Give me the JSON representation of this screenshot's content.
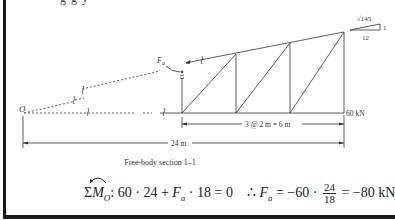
{
  "top_cutoff_text": "g                                   g                                          y",
  "diagram": {
    "point_label": "O",
    "force_label": "F",
    "force_subscript": "a",
    "load_label": "60 kN",
    "dimension_panels": "3 @ 2 m = 6 m",
    "dimension_total": "24 m",
    "slope": {
      "hypotenuse": "√145",
      "rise": "1",
      "run": "12"
    }
  },
  "caption": "Free-body section 1–1",
  "equation": {
    "sum": "Σ",
    "moment": "M",
    "moment_sub": "O",
    "lhs": ": 60 · 24 + ",
    "fa": "F",
    "fa_sub": "a",
    "lhs_rest": " · 18 = 0",
    "therefore": "∴ ",
    "rhs_start": " = −60 · ",
    "frac_num": "24",
    "frac_den": "18",
    "rhs_end": " = −80 kN"
  }
}
